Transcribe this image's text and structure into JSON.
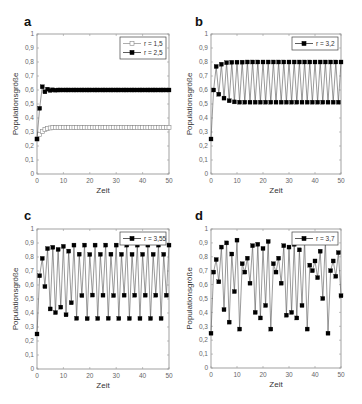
{
  "figure": {
    "panels": [
      {
        "letter": "a",
        "legend": [
          {
            "label": "r = 1,5",
            "marker": "open-square"
          },
          {
            "label": "r = 2,5",
            "marker": "filled-square"
          }
        ]
      },
      {
        "letter": "b",
        "legend": [
          {
            "label": "r = 3,2",
            "marker": "filled-square"
          }
        ]
      },
      {
        "letter": "c",
        "legend": [
          {
            "label": "r = 3,55",
            "marker": "filled-square"
          }
        ]
      },
      {
        "letter": "d",
        "legend": [
          {
            "label": "r = 3,7",
            "marker": "filled-square"
          }
        ]
      }
    ],
    "xlabel": "Zeit",
    "ylabel": "Populationsgröße",
    "xticks": [
      "0",
      "10",
      "20",
      "30",
      "40",
      "50"
    ],
    "yticks": [
      "0",
      "0,1",
      "0,2",
      "0,3",
      "0,4",
      "0,5",
      "0,6",
      "0,7",
      "0,8",
      "0,9",
      "1"
    ]
  },
  "chart_data": [
    {
      "type": "line",
      "panel": "a",
      "title": "",
      "xlabel": "Zeit",
      "ylabel": "Populationsgröße",
      "xlim": [
        0,
        50
      ],
      "ylim": [
        0,
        1
      ],
      "legend_position": "upper right",
      "grid": false,
      "x": [
        0,
        1,
        2,
        3,
        4,
        5,
        6,
        7,
        8,
        9,
        10,
        11,
        12,
        13,
        14,
        15,
        16,
        17,
        18,
        19,
        20,
        21,
        22,
        23,
        24,
        25,
        26,
        27,
        28,
        29,
        30,
        31,
        32,
        33,
        34,
        35,
        36,
        37,
        38,
        39,
        40,
        41,
        42,
        43,
        44,
        45,
        46,
        47,
        48,
        49,
        50
      ],
      "series": [
        {
          "name": "r = 1,5",
          "marker": "open-square",
          "values": [
            0.25,
            0.281,
            0.303,
            0.317,
            0.325,
            0.329,
            0.331,
            0.332,
            0.333,
            0.333,
            0.333,
            0.333,
            0.333,
            0.333,
            0.333,
            0.333,
            0.333,
            0.333,
            0.333,
            0.333,
            0.333,
            0.333,
            0.333,
            0.333,
            0.333,
            0.333,
            0.333,
            0.333,
            0.333,
            0.333,
            0.333,
            0.333,
            0.333,
            0.333,
            0.333,
            0.333,
            0.333,
            0.333,
            0.333,
            0.333,
            0.333,
            0.333,
            0.333,
            0.333,
            0.333,
            0.333,
            0.333,
            0.333,
            0.333,
            0.333,
            0.333
          ]
        },
        {
          "name": "r = 2,5",
          "marker": "filled-square",
          "values": [
            0.25,
            0.469,
            0.623,
            0.587,
            0.606,
            0.597,
            0.601,
            0.599,
            0.6,
            0.6,
            0.6,
            0.6,
            0.6,
            0.6,
            0.6,
            0.6,
            0.6,
            0.6,
            0.6,
            0.6,
            0.6,
            0.6,
            0.6,
            0.6,
            0.6,
            0.6,
            0.6,
            0.6,
            0.6,
            0.6,
            0.6,
            0.6,
            0.6,
            0.6,
            0.6,
            0.6,
            0.6,
            0.6,
            0.6,
            0.6,
            0.6,
            0.6,
            0.6,
            0.6,
            0.6,
            0.6,
            0.6,
            0.6,
            0.6,
            0.6,
            0.6
          ]
        }
      ]
    },
    {
      "type": "line",
      "panel": "b",
      "title": "",
      "xlabel": "Zeit",
      "ylabel": "Populationsgröße",
      "xlim": [
        0,
        50
      ],
      "ylim": [
        0,
        1
      ],
      "legend_position": "upper right",
      "grid": false,
      "x": [
        0,
        1,
        2,
        3,
        4,
        5,
        6,
        7,
        8,
        9,
        10,
        11,
        12,
        13,
        14,
        15,
        16,
        17,
        18,
        19,
        20,
        21,
        22,
        23,
        24,
        25,
        26,
        27,
        28,
        29,
        30,
        31,
        32,
        33,
        34,
        35,
        36,
        37,
        38,
        39,
        40,
        41,
        42,
        43,
        44,
        45,
        46,
        47,
        48,
        49,
        50
      ],
      "series": [
        {
          "name": "r = 3,2",
          "marker": "filled-square",
          "values": [
            0.25,
            0.6,
            0.768,
            0.57,
            0.784,
            0.542,
            0.795,
            0.523,
            0.798,
            0.515,
            0.799,
            0.513,
            0.799,
            0.513,
            0.8,
            0.513,
            0.8,
            0.513,
            0.8,
            0.513,
            0.8,
            0.513,
            0.8,
            0.513,
            0.8,
            0.513,
            0.8,
            0.513,
            0.8,
            0.513,
            0.8,
            0.513,
            0.8,
            0.513,
            0.8,
            0.513,
            0.8,
            0.513,
            0.8,
            0.513,
            0.8,
            0.513,
            0.8,
            0.513,
            0.8,
            0.513,
            0.8,
            0.513,
            0.8,
            0.513,
            0.8
          ]
        }
      ]
    },
    {
      "type": "line",
      "panel": "c",
      "title": "",
      "xlabel": "Zeit",
      "ylabel": "Populationsgröße",
      "xlim": [
        0,
        50
      ],
      "ylim": [
        0,
        1
      ],
      "legend_position": "upper right",
      "grid": false,
      "x": [
        0,
        1,
        2,
        3,
        4,
        5,
        6,
        7,
        8,
        9,
        10,
        11,
        12,
        13,
        14,
        15,
        16,
        17,
        18,
        19,
        20,
        21,
        22,
        23,
        24,
        25,
        26,
        27,
        28,
        29,
        30,
        31,
        32,
        33,
        34,
        35,
        36,
        37,
        38,
        39,
        40,
        41,
        42,
        43,
        44,
        45,
        46,
        47,
        48,
        49,
        50
      ],
      "series": [
        {
          "name": "r = 3,55",
          "marker": "filled-square",
          "values": [
            0.25,
            0.666,
            0.79,
            0.589,
            0.86,
            0.429,
            0.869,
            0.403,
            0.854,
            0.442,
            0.876,
            0.387,
            0.842,
            0.473,
            0.885,
            0.362,
            0.82,
            0.525,
            0.885,
            0.36,
            0.818,
            0.528,
            0.885,
            0.361,
            0.819,
            0.527,
            0.885,
            0.362,
            0.82,
            0.525,
            0.885,
            0.361,
            0.819,
            0.527,
            0.885,
            0.361,
            0.819,
            0.527,
            0.885,
            0.361,
            0.819,
            0.527,
            0.885,
            0.361,
            0.819,
            0.527,
            0.885,
            0.361,
            0.819,
            0.527,
            0.885
          ]
        }
      ]
    },
    {
      "type": "line",
      "panel": "d",
      "title": "",
      "xlabel": "Zeit",
      "ylabel": "Populationsgröße",
      "xlim": [
        0,
        50
      ],
      "ylim": [
        0,
        1
      ],
      "legend_position": "upper right",
      "grid": false,
      "x": [
        0,
        1,
        2,
        3,
        4,
        5,
        6,
        7,
        8,
        9,
        10,
        11,
        12,
        13,
        14,
        15,
        16,
        17,
        18,
        19,
        20,
        21,
        22,
        23,
        24,
        25,
        26,
        27,
        28,
        29,
        30,
        31,
        32,
        33,
        34,
        35,
        36,
        37,
        38,
        39,
        40,
        41,
        42,
        43,
        44,
        45,
        46,
        47,
        48,
        49,
        50
      ],
      "series": [
        {
          "name": "r = 3,7",
          "marker": "filled-square",
          "values": [
            0.25,
            0.69,
            0.78,
            0.62,
            0.87,
            0.42,
            0.9,
            0.33,
            0.82,
            0.55,
            0.92,
            0.28,
            0.75,
            0.69,
            0.79,
            0.61,
            0.88,
            0.4,
            0.89,
            0.36,
            0.86,
            0.45,
            0.91,
            0.28,
            0.75,
            0.69,
            0.79,
            0.61,
            0.88,
            0.38,
            0.87,
            0.4,
            0.89,
            0.36,
            0.85,
            0.45,
            0.92,
            0.28,
            0.74,
            0.7,
            0.77,
            0.65,
            0.84,
            0.5,
            0.92,
            0.25,
            0.7,
            0.77,
            0.66,
            0.83,
            0.52
          ]
        }
      ]
    }
  ]
}
